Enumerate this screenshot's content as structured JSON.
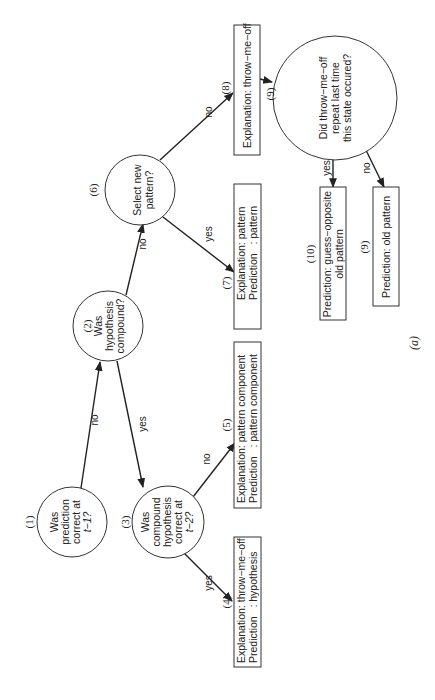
{
  "figure": {
    "caption": "(a)",
    "orientation": "rotated 90° counter-clockwise"
  },
  "nodes": {
    "n1": {
      "number": "(1)",
      "lines": [
        "Was",
        "prediction",
        "correct at",
        "t−1?"
      ]
    },
    "n2": {
      "number": "(2)",
      "lines": [
        "Was",
        "hypothesis",
        "compound?"
      ]
    },
    "n3": {
      "number": "(3)",
      "lines": [
        "Was",
        "compound",
        "hypothesis",
        "correct at",
        "t−2?"
      ]
    },
    "n4": {
      "number": "(4)",
      "lines": [
        "Explanation: throw−me−off",
        "Prediction   : hypothesis"
      ]
    },
    "n5": {
      "number": "(5)",
      "lines": [
        "Explanation: pattern component",
        "Prediction   : pattern component"
      ]
    },
    "n6": {
      "number": "(6)",
      "lines": [
        "Select new",
        "pattern?"
      ]
    },
    "n7": {
      "number": "(7)",
      "lines": [
        "Explanation: pattern",
        "Prediction   : pattern"
      ]
    },
    "n8": {
      "number": "(8)",
      "lines": [
        "Explanation: throw−me−off"
      ]
    },
    "n9": {
      "number": "(9)",
      "lines": [
        "Did throw−me−off",
        "repeat last time",
        "this state occured?"
      ]
    },
    "n10": {
      "number": "(10)",
      "lines": [
        "Prediction: guess−opposite",
        "old pattern"
      ]
    },
    "n9b": {
      "number": "(9)",
      "lines": [
        "Prediction: old pattern"
      ]
    }
  },
  "edges": {
    "e1_2": "no",
    "e2_3": "yes",
    "e2_6": "no",
    "e3_4": "yes",
    "e3_5": "no",
    "e6_7": "yes",
    "e6_8": "no",
    "e9_10": "yes",
    "e9_9b": "no"
  }
}
